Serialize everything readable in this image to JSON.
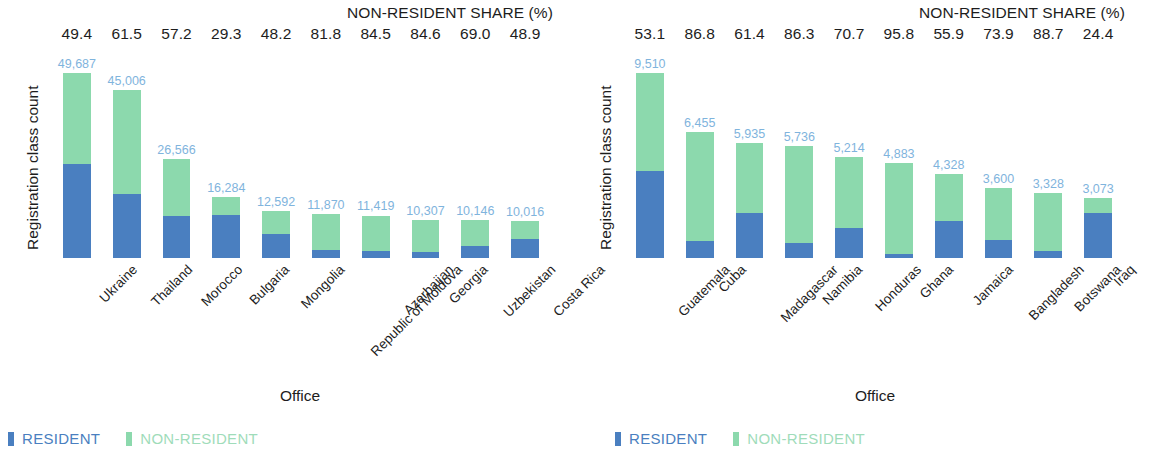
{
  "colors": {
    "resident": "#4a7fc0",
    "non_resident": "#8cd9ad",
    "value_label": "#7fb4dd",
    "text": "#1d1d1d",
    "background": "#ffffff"
  },
  "panels": [
    {
      "id": "left",
      "share_header": "NON-RESIDENT SHARE (%)",
      "ylabel": "Registration class count",
      "xlabel": "Office",
      "legend": [
        {
          "label": "RESIDENT",
          "color": "#4a7fc0"
        },
        {
          "label": "NON-RESIDENT",
          "color": "#8cd9ad"
        }
      ],
      "shares": [
        "49.4",
        "61.5",
        "57.2",
        "29.3",
        "48.2",
        "81.8",
        "84.5",
        "84.6",
        "69.0",
        "48.9"
      ],
      "categories": [
        "Ukraine",
        "Thailand",
        "Morocco",
        "Bulgaria",
        "Mongolia",
        "Republic of Moldova",
        "Azerbaijan",
        "Georgia",
        "Uzbekistan",
        "Costa Rica"
      ],
      "value_labels": [
        "49,687",
        "45,006",
        "26,566",
        "16,284",
        "12,592",
        "11,870",
        "11,419",
        "10,307",
        "10,146",
        "10,016"
      ]
    },
    {
      "id": "right",
      "share_header": "NON-RESIDENT SHARE (%)",
      "ylabel": "Registration class count",
      "xlabel": "Office",
      "legend": [
        {
          "label": "RESIDENT",
          "color": "#4a7fc0"
        },
        {
          "label": "NON-RESIDENT",
          "color": "#8cd9ad"
        }
      ],
      "shares": [
        "53.1",
        "86.8",
        "61.4",
        "86.3",
        "70.7",
        "95.8",
        "55.9",
        "73.9",
        "88.7",
        "24.4"
      ],
      "categories": [
        "Guatemala",
        "Cuba",
        "Madagascar",
        "Namibia",
        "Honduras",
        "Ghana",
        "Jamaica",
        "Bangladesh",
        "Botswana",
        "Iraq"
      ],
      "value_labels": [
        "9,510",
        "6,455",
        "5,935",
        "5,736",
        "5,214",
        "4,883",
        "4,328",
        "3,600",
        "3,328",
        "3,073"
      ]
    }
  ],
  "chart_data": [
    {
      "type": "bar",
      "subtype": "stacked",
      "title": "NON-RESIDENT SHARE (%)",
      "xlabel": "Office",
      "ylabel": "Registration class count",
      "categories": [
        "Ukraine",
        "Thailand",
        "Morocco",
        "Bulgaria",
        "Mongolia",
        "Republic of Moldova",
        "Azerbaijan",
        "Georgia",
        "Uzbekistan",
        "Costa Rica"
      ],
      "totals": [
        49687,
        45006,
        26566,
        16284,
        12592,
        11870,
        11419,
        10307,
        10146,
        10016
      ],
      "non_resident_share_pct": [
        49.4,
        61.5,
        57.2,
        29.3,
        48.2,
        81.8,
        84.5,
        84.6,
        69.0,
        48.9
      ],
      "series": [
        {
          "name": "RESIDENT",
          "color": "#4a7fc0",
          "values": [
            25142,
            17327,
            11370,
            11513,
            6523,
            2161,
            1770,
            1587,
            3145,
            5118
          ]
        },
        {
          "name": "NON-RESIDENT",
          "color": "#8cd9ad",
          "values": [
            24545,
            27679,
            15196,
            4771,
            6069,
            9709,
            9649,
            8720,
            7001,
            4898
          ]
        }
      ],
      "ylim": [
        0,
        49687
      ],
      "grid": false,
      "legend_position": "bottom-left",
      "annotations": "Each bar is labelled above with its total registration class count; the row of numbers across the top gives the non-resident share in percent."
    },
    {
      "type": "bar",
      "subtype": "stacked",
      "title": "NON-RESIDENT SHARE (%)",
      "xlabel": "Office",
      "ylabel": "Registration class count",
      "categories": [
        "Guatemala",
        "Cuba",
        "Madagascar",
        "Namibia",
        "Honduras",
        "Ghana",
        "Jamaica",
        "Bangladesh",
        "Botswana",
        "Iraq"
      ],
      "totals": [
        9510,
        6455,
        5935,
        5736,
        5214,
        4883,
        4328,
        3600,
        3328,
        3073
      ],
      "non_resident_share_pct": [
        53.1,
        86.8,
        61.4,
        86.3,
        70.7,
        95.8,
        55.9,
        73.9,
        88.7,
        24.4
      ],
      "series": [
        {
          "name": "RESIDENT",
          "color": "#4a7fc0",
          "values": [
            4460,
            852,
            2291,
            786,
            1528,
            205,
            1909,
            939,
            376,
            2323
          ]
        },
        {
          "name": "NON-RESIDENT",
          "color": "#8cd9ad",
          "values": [
            5050,
            5603,
            3644,
            4950,
            3686,
            4678,
            2419,
            2661,
            2952,
            750
          ]
        }
      ],
      "ylim": [
        0,
        9510
      ],
      "grid": false,
      "legend_position": "bottom-left",
      "annotations": "Each bar is labelled above with its total registration class count; the row of numbers across the top gives the non-resident share in percent."
    }
  ]
}
